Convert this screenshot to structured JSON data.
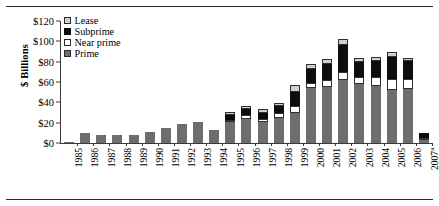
{
  "figure": {
    "ylabel": "$ Billions",
    "rule_color": "#2b2b2b"
  },
  "legend": {
    "items": [
      {
        "label": "Lease",
        "key": "lease",
        "color": "#cfcfcf"
      },
      {
        "label": "Subprime",
        "key": "subprime",
        "color": "#0d0d0d"
      },
      {
        "label": "Near prime",
        "key": "nearprime",
        "color": "#ffffff"
      },
      {
        "label": "Prime",
        "key": "prime",
        "color": "#6e6e6e"
      }
    ]
  },
  "chart_data": {
    "type": "bar",
    "stacked": true,
    "title": "",
    "xlabel": "",
    "ylabel": "$ Billions",
    "ylim": [
      0,
      120
    ],
    "ytick_labels": [
      "$0",
      "$20",
      "$40",
      "$60",
      "$80",
      "$100",
      "$120"
    ],
    "ytick_values": [
      0,
      20,
      40,
      60,
      80,
      100,
      120
    ],
    "grid": false,
    "legend_position": "upper-left-inside",
    "categories": [
      "1985",
      "1986",
      "1987",
      "1988",
      "1989",
      "1990",
      "1991",
      "1992",
      "1993",
      "1994",
      "1995",
      "1996",
      "1997",
      "1998",
      "1999",
      "2000",
      "2001",
      "2002",
      "2003",
      "2004",
      "2005",
      "2006",
      "2007"
    ],
    "category_notes": {
      "2007": "a"
    },
    "series": [
      {
        "name": "Prime",
        "key": "prime",
        "values": [
          1,
          10,
          8,
          8,
          8,
          11,
          15,
          19,
          21,
          13,
          21,
          24,
          21,
          25,
          30,
          54,
          55,
          62,
          58,
          56,
          52,
          53,
          3
        ]
      },
      {
        "name": "Near prime",
        "key": "nearprime",
        "values": [
          0,
          0,
          0,
          0,
          0,
          0,
          0,
          0,
          0,
          0,
          2,
          4,
          3,
          5,
          6,
          5,
          7,
          8,
          7,
          9,
          11,
          10,
          1
        ]
      },
      {
        "name": "Subprime",
        "key": "subprime",
        "values": [
          0,
          0,
          0,
          0,
          0,
          0,
          0,
          0,
          0,
          0,
          5,
          5,
          6,
          6,
          14,
          14,
          16,
          26,
          15,
          16,
          22,
          18,
          5
        ]
      },
      {
        "name": "Lease",
        "key": "lease",
        "values": [
          0,
          0,
          0,
          0,
          0,
          0,
          0,
          0,
          0,
          0,
          3,
          3,
          3,
          3,
          7,
          5,
          5,
          6,
          4,
          4,
          5,
          3,
          0
        ]
      }
    ]
  }
}
